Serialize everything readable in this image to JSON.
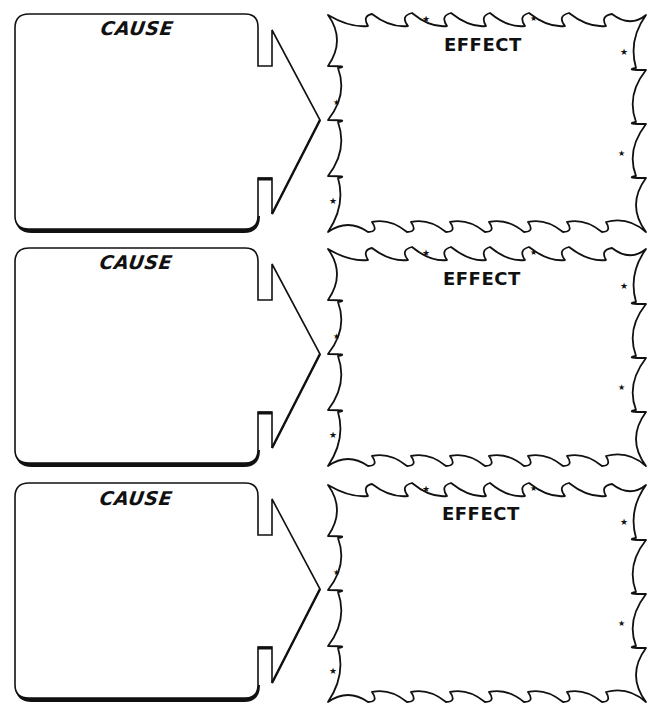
{
  "worksheet": {
    "type": "cause-and-effect graphic organizer",
    "rows": [
      {
        "cause_label": "CAUSE",
        "effect_label": "EFFECT",
        "cause_text": "",
        "effect_text": ""
      },
      {
        "cause_label": "CAUSE",
        "effect_label": "EFFECT",
        "cause_text": "",
        "effect_text": ""
      },
      {
        "cause_label": "CAUSE",
        "effect_label": "EFFECT",
        "cause_text": "",
        "effect_text": ""
      }
    ],
    "colors": {
      "ink": "#111111",
      "paper": "#ffffff"
    }
  }
}
